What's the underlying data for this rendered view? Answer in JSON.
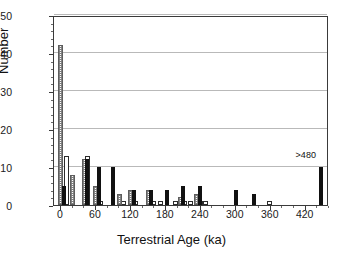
{
  "chart_data": {
    "type": "bar",
    "title": "",
    "subtitle": "",
    "xlabel": "Terrestrial Age (ka)",
    "ylabel": "Number",
    "xlim": [
      -12,
      460
    ],
    "ylim": [
      0,
      50
    ],
    "xticks": [
      0,
      60,
      120,
      180,
      240,
      300,
      360,
      420
    ],
    "yticks": [
      0,
      10,
      20,
      30,
      40,
      50
    ],
    "x_minor_interval": 20,
    "y_minor_interval": 2,
    "grid": "horizontal",
    "legend": "none",
    "bin_width_ka": 10,
    "annotations": [
      {
        "text": ">480",
        "x": 447,
        "y": 11.8
      }
    ],
    "series": [
      {
        "name": "hatched",
        "style": "stippled-hatch",
        "points": [
          {
            "x": 0,
            "y": 42
          },
          {
            "x": 20,
            "y": 8
          },
          {
            "x": 40,
            "y": 12
          },
          {
            "x": 60,
            "y": 5
          },
          {
            "x": 100,
            "y": 3
          },
          {
            "x": 120,
            "y": 4
          },
          {
            "x": 150,
            "y": 4
          },
          {
            "x": 205,
            "y": 2
          },
          {
            "x": 232,
            "y": 3
          }
        ]
      },
      {
        "name": "open",
        "style": "white-outline",
        "points": [
          {
            "x": 10,
            "y": 13
          },
          {
            "x": 45,
            "y": 13
          },
          {
            "x": 68,
            "y": 1
          },
          {
            "x": 108,
            "y": 1
          },
          {
            "x": 128,
            "y": 1
          },
          {
            "x": 158,
            "y": 1
          },
          {
            "x": 170,
            "y": 1
          },
          {
            "x": 196,
            "y": 1
          },
          {
            "x": 212,
            "y": 1
          },
          {
            "x": 222,
            "y": 1
          },
          {
            "x": 240,
            "y": 1
          },
          {
            "x": 248,
            "y": 1
          },
          {
            "x": 358,
            "y": 1
          }
        ]
      },
      {
        "name": "solid",
        "style": "solid-black",
        "points": [
          {
            "x": 6,
            "y": 5
          },
          {
            "x": 45,
            "y": 12
          },
          {
            "x": 65,
            "y": 10
          },
          {
            "x": 90,
            "y": 10
          },
          {
            "x": 125,
            "y": 4
          },
          {
            "x": 155,
            "y": 4
          },
          {
            "x": 182,
            "y": 4
          },
          {
            "x": 210,
            "y": 5
          },
          {
            "x": 238,
            "y": 5
          },
          {
            "x": 300,
            "y": 4
          },
          {
            "x": 332,
            "y": 3
          },
          {
            "x": 447,
            "y": 10
          }
        ]
      }
    ]
  }
}
